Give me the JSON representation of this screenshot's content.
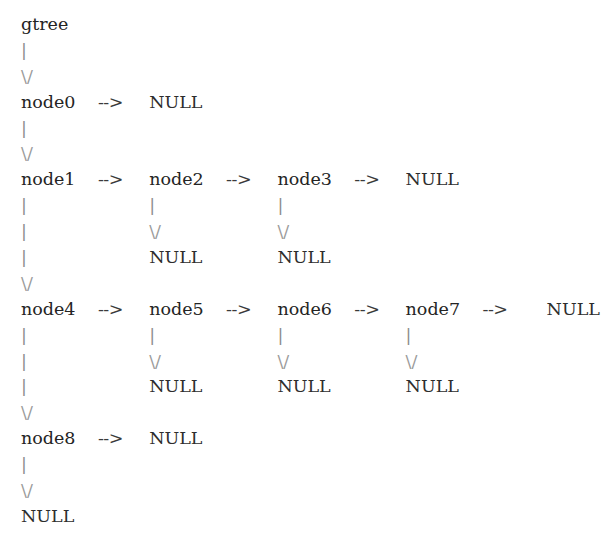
{
  "diagram": {
    "title": "gtree",
    "kind": "ascii-art-linked-tree",
    "background_color": "#ffffff",
    "text_color": "#2b2b2b",
    "connector_color": "#8d8d8d",
    "glyphs": {
      "pipe": "|",
      "vee": "\\/",
      "arrow": "-->",
      "null": "NULL"
    },
    "root": "gtree",
    "rows": [
      {
        "id": "row-root",
        "type": "label",
        "cells": [
          {
            "col": 0,
            "kind": "root",
            "text": "gtree"
          }
        ]
      },
      {
        "id": "row-root-pipe",
        "type": "connector",
        "cells": [
          {
            "col": 0,
            "kind": "pipe",
            "text": "|"
          }
        ]
      },
      {
        "id": "row-root-vee",
        "type": "connector",
        "cells": [
          {
            "col": 0,
            "kind": "vee",
            "text": "\\/"
          }
        ]
      },
      {
        "id": "row-level-0",
        "type": "chain",
        "cells": [
          {
            "col": 0,
            "kind": "node",
            "text": "node0"
          },
          {
            "col": 6,
            "kind": "arrow",
            "text": "-->"
          },
          {
            "col": 10,
            "kind": "null",
            "text": "NULL"
          }
        ]
      },
      {
        "id": "row-level-0-pipe",
        "type": "connector",
        "cells": [
          {
            "col": 0,
            "kind": "pipe",
            "text": "|"
          }
        ]
      },
      {
        "id": "row-level-0-vee",
        "type": "connector",
        "cells": [
          {
            "col": 0,
            "kind": "vee",
            "text": "\\/"
          }
        ]
      },
      {
        "id": "row-level-1",
        "type": "chain",
        "cells": [
          {
            "col": 0,
            "kind": "node",
            "text": "node1"
          },
          {
            "col": 6,
            "kind": "arrow",
            "text": "-->"
          },
          {
            "col": 10,
            "kind": "node",
            "text": "node2"
          },
          {
            "col": 16,
            "kind": "arrow",
            "text": "-->"
          },
          {
            "col": 20,
            "kind": "node",
            "text": "node3"
          },
          {
            "col": 26,
            "kind": "arrow",
            "text": "-->"
          },
          {
            "col": 30,
            "kind": "null",
            "text": "NULL"
          }
        ]
      },
      {
        "id": "row-level-1-pipes-a",
        "type": "connector",
        "cells": [
          {
            "col": 0,
            "kind": "pipe",
            "text": "|"
          },
          {
            "col": 10,
            "kind": "pipe",
            "text": "|"
          },
          {
            "col": 20,
            "kind": "pipe",
            "text": "|"
          }
        ]
      },
      {
        "id": "row-level-1-pipes-b",
        "type": "connector",
        "cells": [
          {
            "col": 0,
            "kind": "pipe",
            "text": "|"
          },
          {
            "col": 10,
            "kind": "vee",
            "text": "\\/"
          },
          {
            "col": 20,
            "kind": "vee",
            "text": "\\/"
          }
        ]
      },
      {
        "id": "row-level-1-nulls",
        "type": "connector",
        "cells": [
          {
            "col": 0,
            "kind": "pipe",
            "text": "|"
          },
          {
            "col": 10,
            "kind": "null",
            "text": "NULL"
          },
          {
            "col": 20,
            "kind": "null",
            "text": "NULL"
          }
        ]
      },
      {
        "id": "row-level-1-vee",
        "type": "connector",
        "cells": [
          {
            "col": 0,
            "kind": "vee",
            "text": "\\/"
          }
        ]
      },
      {
        "id": "row-level-2",
        "type": "chain",
        "cells": [
          {
            "col": 0,
            "kind": "node",
            "text": "node4"
          },
          {
            "col": 6,
            "kind": "arrow",
            "text": "-->"
          },
          {
            "col": 10,
            "kind": "node",
            "text": "node5"
          },
          {
            "col": 16,
            "kind": "arrow",
            "text": "-->"
          },
          {
            "col": 20,
            "kind": "node",
            "text": "node6"
          },
          {
            "col": 26,
            "kind": "arrow",
            "text": "-->"
          },
          {
            "col": 30,
            "kind": "node",
            "text": "node7"
          },
          {
            "col": 36,
            "kind": "arrow",
            "text": "-->"
          },
          {
            "col": 41,
            "kind": "null",
            "text": "NULL"
          }
        ]
      },
      {
        "id": "row-level-2-pipes-a",
        "type": "connector",
        "cells": [
          {
            "col": 0,
            "kind": "pipe",
            "text": "|"
          },
          {
            "col": 10,
            "kind": "pipe",
            "text": "|"
          },
          {
            "col": 20,
            "kind": "pipe",
            "text": "|"
          },
          {
            "col": 30,
            "kind": "pipe",
            "text": "|"
          }
        ]
      },
      {
        "id": "row-level-2-pipes-b",
        "type": "connector",
        "cells": [
          {
            "col": 0,
            "kind": "pipe",
            "text": "|"
          },
          {
            "col": 10,
            "kind": "vee",
            "text": "\\/"
          },
          {
            "col": 20,
            "kind": "vee",
            "text": "\\/"
          },
          {
            "col": 30,
            "kind": "vee",
            "text": "\\/"
          }
        ]
      },
      {
        "id": "row-level-2-nulls",
        "type": "connector",
        "cells": [
          {
            "col": 0,
            "kind": "pipe",
            "text": "|"
          },
          {
            "col": 10,
            "kind": "null",
            "text": "NULL"
          },
          {
            "col": 20,
            "kind": "null",
            "text": "NULL"
          },
          {
            "col": 30,
            "kind": "null",
            "text": "NULL"
          }
        ]
      },
      {
        "id": "row-level-2-vee",
        "type": "connector",
        "cells": [
          {
            "col": 0,
            "kind": "vee",
            "text": "\\/"
          }
        ]
      },
      {
        "id": "row-level-3",
        "type": "chain",
        "cells": [
          {
            "col": 0,
            "kind": "node",
            "text": "node8"
          },
          {
            "col": 6,
            "kind": "arrow",
            "text": "-->"
          },
          {
            "col": 10,
            "kind": "null",
            "text": "NULL"
          }
        ]
      },
      {
        "id": "row-level-3-pipe",
        "type": "connector",
        "cells": [
          {
            "col": 0,
            "kind": "pipe",
            "text": "|"
          }
        ]
      },
      {
        "id": "row-level-3-vee",
        "type": "connector",
        "cells": [
          {
            "col": 0,
            "kind": "vee",
            "text": "\\/"
          }
        ]
      },
      {
        "id": "row-terminal-null",
        "type": "label",
        "cells": [
          {
            "col": 0,
            "kind": "null",
            "text": "NULL"
          }
        ]
      }
    ]
  }
}
